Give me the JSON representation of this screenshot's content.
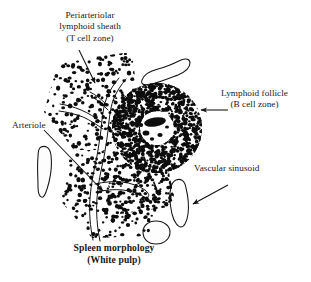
{
  "figure": {
    "kind": "scientific-illustration",
    "background_color": "#ffffff",
    "ink_color": "#111111"
  },
  "labels": {
    "pals": {
      "line1": "Periarteriolar",
      "line2": "lymphoid sheath",
      "line3": "(T cell zone)"
    },
    "follicle": {
      "line1": "Lymphoid follicle",
      "line2": "(B cell zone)"
    },
    "arteriole": {
      "line1": "Arteriole"
    },
    "sinusoid": {
      "line1": "Vascular sinusoid"
    }
  },
  "caption": {
    "line1": "Spleen morphology",
    "line2": "(White pulp)"
  },
  "structures": {
    "lymphoid_follicle": {
      "name": "Lymphoid follicle (B cell zone)",
      "center": [
        157,
        128
      ],
      "outer_radius": 45,
      "inner_radius": 17,
      "description": "dense ring of lymphocytes with pale germinal center"
    },
    "arteriole": {
      "name": "Central arteriole",
      "description": "branching outlined vessel running through the white pulp"
    },
    "pals": {
      "name": "Periarteriolar lymphoid sheath",
      "description": "scattered lymphocytes cuffing the arteriole branches"
    },
    "vascular_sinusoids": [
      {
        "id": "sinusoid-top",
        "center": [
          163,
          74
        ]
      },
      {
        "id": "sinusoid-left",
        "center": [
          45,
          170
        ]
      },
      {
        "id": "sinusoid-right",
        "center": [
          180,
          203
        ]
      },
      {
        "id": "sinusoid-bottom",
        "center": [
          156,
          232
        ]
      }
    ]
  },
  "leaders": {
    "pals_arrow": {
      "from": [
        80,
        52
      ],
      "to": [
        95,
        84
      ],
      "head": "arrow"
    },
    "follicle_arrow": {
      "from": [
        227,
        110
      ],
      "to": [
        200,
        110
      ],
      "head": "arrow"
    },
    "arteriole_line": {
      "from": [
        45,
        131
      ],
      "to": [
        102,
        190
      ],
      "head": "arrow"
    },
    "sinusoid_arrow": {
      "from": [
        226,
        186
      ],
      "to": [
        192,
        204
      ],
      "head": "arrow"
    }
  }
}
